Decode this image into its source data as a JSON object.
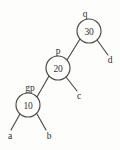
{
  "figure": {
    "kind": "binary-search-tree-diagram",
    "background_color": "#fdfdfc",
    "line_color": "#4a4a4a",
    "text_color": "#2e2e2e",
    "width": 120,
    "height": 150
  },
  "nodes": [
    {
      "id": "node-30",
      "value": "30",
      "pointer_label": "q",
      "cx": 89,
      "cy": 31,
      "r": 12,
      "label_x": 85,
      "label_y": 17
    },
    {
      "id": "node-20",
      "value": "20",
      "pointer_label": "p",
      "cx": 58,
      "cy": 68,
      "r": 12,
      "label_x": 58,
      "label_y": 54
    },
    {
      "id": "node-10",
      "value": "10",
      "pointer_label": "gp",
      "cx": 28,
      "cy": 105,
      "r": 12,
      "label_x": 30,
      "label_y": 91
    }
  ],
  "leaves": [
    {
      "id": "leaf-d",
      "label": "d",
      "x": 110,
      "y": 63,
      "edge_from": "node-30",
      "edge_x1": 97,
      "edge_y1": 40,
      "edge_x2": 108,
      "edge_y2": 55
    },
    {
      "id": "leaf-c",
      "label": "c",
      "x": 79,
      "y": 99,
      "edge_from": "node-20",
      "edge_x1": 66,
      "edge_y1": 77,
      "edge_x2": 77,
      "edge_y2": 91
    },
    {
      "id": "leaf-a",
      "label": "a",
      "x": 10,
      "y": 139,
      "edge_from": "node-10",
      "edge_x1": 20,
      "edge_y1": 114,
      "edge_x2": 11,
      "edge_y2": 130
    },
    {
      "id": "leaf-b",
      "label": "b",
      "x": 49,
      "y": 139,
      "edge_from": "node-10",
      "edge_x1": 37,
      "edge_y1": 114,
      "edge_x2": 46,
      "edge_y2": 130
    }
  ],
  "links": [
    {
      "id": "link-30-20",
      "from": "node-30",
      "to": "node-20",
      "x1": 80,
      "y1": 39,
      "x2": 67,
      "y2": 60
    },
    {
      "id": "link-20-10",
      "from": "node-20",
      "to": "node-10",
      "x1": 49,
      "y1": 76,
      "x2": 37,
      "y2": 97
    }
  ]
}
